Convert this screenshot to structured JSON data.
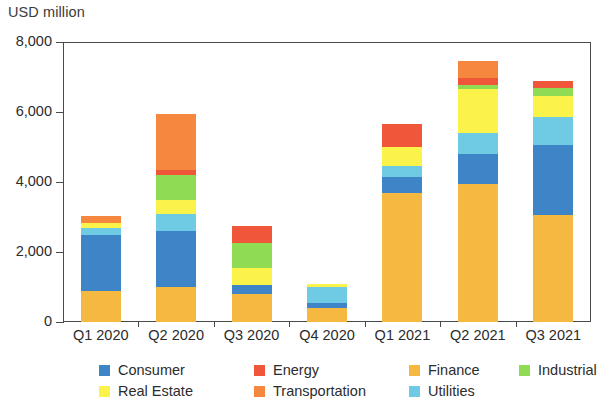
{
  "chart_data": {
    "type": "bar",
    "title": "",
    "ylabel": "USD million",
    "xlabel": "",
    "ylim": [
      0,
      8000
    ],
    "yticks": [
      0,
      2000,
      4000,
      6000,
      8000
    ],
    "ytick_labels": [
      "0",
      "2,000",
      "4,000",
      "6,000",
      "8,000"
    ],
    "grid": false,
    "stacked": true,
    "legend_position": "bottom",
    "categories": [
      "Q1 2020",
      "Q2 2020",
      "Q3 2020",
      "Q4 2020",
      "Q1 2021",
      "Q2 2021",
      "Q3 2021"
    ],
    "series": [
      {
        "name": "Finance",
        "color": "#f5b942",
        "values": [
          900,
          1000,
          800,
          400,
          3700,
          3950,
          3050
        ]
      },
      {
        "name": "Consumer",
        "color": "#3d85c6",
        "values": [
          1600,
          1600,
          250,
          150,
          450,
          850,
          2000
        ]
      },
      {
        "name": "Utilities",
        "color": "#6fcbe3",
        "values": [
          200,
          500,
          0,
          450,
          300,
          600,
          800
        ]
      },
      {
        "name": "Real Estate",
        "color": "#fbf24a",
        "values": [
          120,
          400,
          500,
          80,
          550,
          1250,
          600
        ]
      },
      {
        "name": "Industrial",
        "color": "#8fdc54",
        "values": [
          0,
          700,
          700,
          0,
          0,
          120,
          250
        ]
      },
      {
        "name": "Energy",
        "color": "#f0563a",
        "values": [
          0,
          150,
          500,
          0,
          650,
          200,
          200
        ]
      },
      {
        "name": "Transportation",
        "color": "#f5873f",
        "values": [
          200,
          1600,
          0,
          0,
          0,
          500,
          0
        ]
      }
    ],
    "totals": [
      3020,
      5950,
      2750,
      1080,
      5650,
      7470,
      6900
    ]
  },
  "legend": {
    "entries": [
      {
        "label": "Consumer",
        "color": "#3d85c6"
      },
      {
        "label": "Energy",
        "color": "#f0563a"
      },
      {
        "label": "Finance",
        "color": "#f5b942"
      },
      {
        "label": "Industrial",
        "color": "#8fdc54"
      },
      {
        "label": "Real Estate",
        "color": "#fbf24a"
      },
      {
        "label": "Transportation",
        "color": "#f5873f"
      },
      {
        "label": "Utilities",
        "color": "#6fcbe3"
      }
    ]
  }
}
